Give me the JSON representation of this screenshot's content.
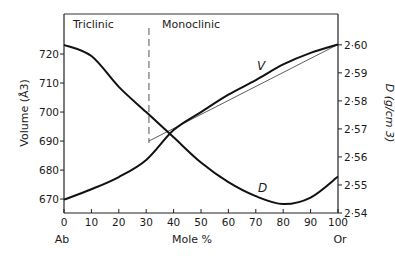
{
  "chart_data": {
    "type": "line",
    "title": "",
    "xlabel": "Mole %",
    "x_end_labels": {
      "left": "Ab",
      "right": "Or"
    },
    "ylabel_left": "Volume (Å3)",
    "ylabel_right": "D (g/cm 3)",
    "xlim": [
      0,
      100
    ],
    "ylim_left": [
      665.2,
      733.8
    ],
    "ylim_right": [
      2.54,
      2.611
    ],
    "x_ticks": [
      0,
      10,
      20,
      30,
      40,
      50,
      60,
      70,
      80,
      90,
      100
    ],
    "y_ticks_left": [
      670,
      680,
      690,
      700,
      710,
      720
    ],
    "y_ticks_right": [
      "2·54",
      "2·55",
      "2·56",
      "2·57",
      "2·58",
      "2·59",
      "2·60"
    ],
    "y_ticks_right_values": [
      2.54,
      2.55,
      2.56,
      2.57,
      2.58,
      2.59,
      2.6
    ],
    "grid": false,
    "regions": [
      {
        "label": "Triclinic",
        "x_from": 0,
        "x_to": 31
      },
      {
        "label": "Monoclinic",
        "x_from": 31,
        "x_to": 100
      }
    ],
    "phase_boundary_x": 31,
    "series": [
      {
        "name": "V",
        "axis": "left",
        "unit": "Å3",
        "x": [
          0,
          10,
          20,
          30,
          40,
          50,
          60,
          70,
          80,
          90,
          100
        ],
        "values": [
          669.8,
          673.4,
          677.6,
          683.5,
          693.8,
          700.0,
          706.0,
          711.0,
          716.4,
          720.4,
          723.3
        ]
      },
      {
        "name": "D",
        "axis": "right",
        "unit": "g/cm3",
        "x": [
          0,
          10,
          20,
          30,
          40,
          50,
          60,
          70,
          80,
          90,
          100
        ],
        "values": [
          2.6,
          2.596,
          2.585,
          2.576,
          2.567,
          2.558,
          2.551,
          2.546,
          2.5432,
          2.5455,
          2.553
        ]
      },
      {
        "name": "ideal linear V (monoclinic)",
        "axis": "left",
        "style": "thin",
        "x": [
          31,
          100
        ],
        "values": [
          690.0,
          723.3
        ]
      }
    ],
    "annotations": [
      {
        "text": "V",
        "x": 72,
        "axis": "left",
        "y": 718
      },
      {
        "text": "D",
        "x": 74,
        "axis": "right",
        "y": 2.547
      }
    ]
  }
}
